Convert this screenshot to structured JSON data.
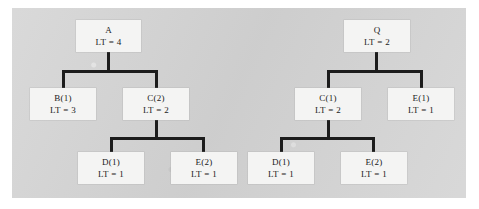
{
  "diagram": {
    "type": "bom-indented-tree",
    "background_color": "#d4d4d4",
    "node_fill": "#f4f4f3",
    "line_color": "#1c1c1c",
    "trees": [
      {
        "name": "tree-a",
        "root": {
          "id": "a",
          "label": "A",
          "lt": "LT = 4",
          "lt_value": 4,
          "qty": null
        },
        "level2": [
          {
            "id": "b1",
            "label": "B(1)",
            "lt": "LT = 3",
            "lt_value": 3,
            "qty": 1
          },
          {
            "id": "c2",
            "label": "C(2)",
            "lt": "LT = 2",
            "lt_value": 2,
            "qty": 2
          }
        ],
        "level3": [
          {
            "id": "d1",
            "label": "D(1)",
            "lt": "LT = 1",
            "lt_value": 1,
            "qty": 1,
            "parent": "c2"
          },
          {
            "id": "e2",
            "label": "E(2)",
            "lt": "LT = 1",
            "lt_value": 1,
            "qty": 2,
            "parent": "c2"
          }
        ]
      },
      {
        "name": "tree-q",
        "root": {
          "id": "q",
          "label": "Q",
          "lt": "LT = 2",
          "lt_value": 2,
          "qty": null
        },
        "level2": [
          {
            "id": "c1",
            "label": "C(1)",
            "lt": "LT = 2",
            "lt_value": 2,
            "qty": 1
          },
          {
            "id": "e1",
            "label": "E(1)",
            "lt": "LT = 1",
            "lt_value": 1,
            "qty": 1
          }
        ],
        "level3": [
          {
            "id": "d1r",
            "label": "D(1)",
            "lt": "LT = 1",
            "lt_value": 1,
            "qty": 1,
            "parent": "c1"
          },
          {
            "id": "e2r",
            "label": "E(2)",
            "lt": "LT = 1",
            "lt_value": 1,
            "qty": 2,
            "parent": "c1"
          }
        ]
      }
    ]
  }
}
